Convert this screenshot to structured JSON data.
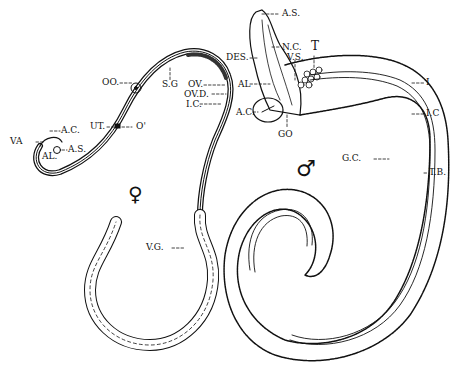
{
  "figure": {
    "type": "anatomical line drawing",
    "colors": {
      "ink": "#111111",
      "background": "#ffffff"
    }
  },
  "female": {
    "symbol": "♀",
    "labels": {
      "va": "VA",
      "ac": "A.C.",
      "al": "AL.",
      "as": "A.S.",
      "ut": "UT.",
      "o": "O'",
      "oo": "OO.",
      "sg": "S.G",
      "ov": "OV.",
      "ovd": "OV.D.",
      "ic": "I.C.",
      "vg": "V.G."
    }
  },
  "male": {
    "symbol": "♂",
    "labels": {
      "as": "A.S.",
      "des": "DES.",
      "nc": "N.C.",
      "t": "T",
      "vs": "V.S.",
      "al": "AL",
      "ac": "A.C.",
      "go": "GO",
      "i": "I",
      "ic": "I.C",
      "gc": "G.C.",
      "tb": "T.B."
    }
  }
}
